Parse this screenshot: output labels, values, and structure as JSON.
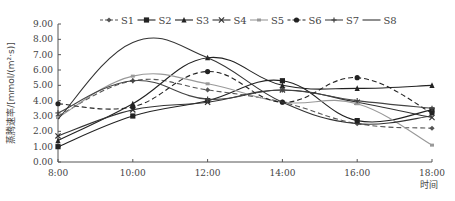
{
  "chart_data": {
    "type": "line",
    "title": "",
    "xlabel": "时间",
    "ylabel": "蒸腾速率/[mmol/(m²·s)]",
    "categories": [
      "8:00",
      "10:00",
      "12:00",
      "14:00",
      "16:00",
      "18:00"
    ],
    "ylim": [
      0,
      9
    ],
    "yticks": [
      "0.00",
      "1.00",
      "2.00",
      "3.00",
      "4.00",
      "5.00",
      "6.00",
      "7.00",
      "8.00",
      "9.00"
    ],
    "grid": false,
    "legend_position": "top",
    "smooth": true,
    "series": [
      {
        "name": "S1",
        "values": [
          3.0,
          5.3,
          4.7,
          3.9,
          2.5,
          2.2
        ],
        "style": "dashed",
        "marker": "diamond",
        "color": "#555555"
      },
      {
        "name": "S2",
        "values": [
          1.0,
          3.0,
          4.0,
          5.3,
          2.7,
          3.4
        ],
        "style": "solid",
        "marker": "square",
        "color": "#222222"
      },
      {
        "name": "S3",
        "values": [
          1.4,
          3.8,
          6.8,
          5.0,
          4.8,
          5.0
        ],
        "style": "solid",
        "marker": "triangle",
        "color": "#222222"
      },
      {
        "name": "S4",
        "values": [
          1.7,
          3.4,
          3.9,
          4.7,
          3.9,
          2.9
        ],
        "style": "solid",
        "marker": "x",
        "color": "#333333"
      },
      {
        "name": "S5",
        "values": [
          2.9,
          5.6,
          5.1,
          3.9,
          3.8,
          1.1
        ],
        "style": "solid",
        "marker": "dash",
        "color": "#999999"
      },
      {
        "name": "S6",
        "values": [
          3.8,
          3.6,
          5.9,
          3.9,
          5.5,
          3.2
        ],
        "style": "dashed",
        "marker": "circle",
        "color": "#222222"
      },
      {
        "name": "S7",
        "values": [
          3.2,
          5.3,
          4.1,
          4.7,
          4.0,
          3.5
        ],
        "style": "solid",
        "marker": "plus",
        "color": "#444444"
      },
      {
        "name": "S8",
        "values": [
          2.8,
          7.8,
          6.8,
          3.9,
          2.5,
          3.0
        ],
        "style": "solid",
        "marker": "none",
        "color": "#333333"
      }
    ]
  }
}
